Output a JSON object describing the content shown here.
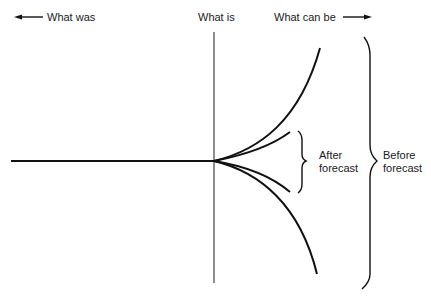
{
  "labels": {
    "what_was": "What was",
    "what_is": "What is",
    "what_can_be": "What can be",
    "after_forecast": [
      "After",
      "forecast"
    ],
    "before_forecast": [
      "Before",
      "forecast"
    ]
  },
  "colors": {
    "line": "#111111",
    "axis": "#444444",
    "background": "#ffffff"
  },
  "icons": {
    "left_arrow": "arrow-left-icon",
    "right_arrow": "arrow-right-icon"
  }
}
